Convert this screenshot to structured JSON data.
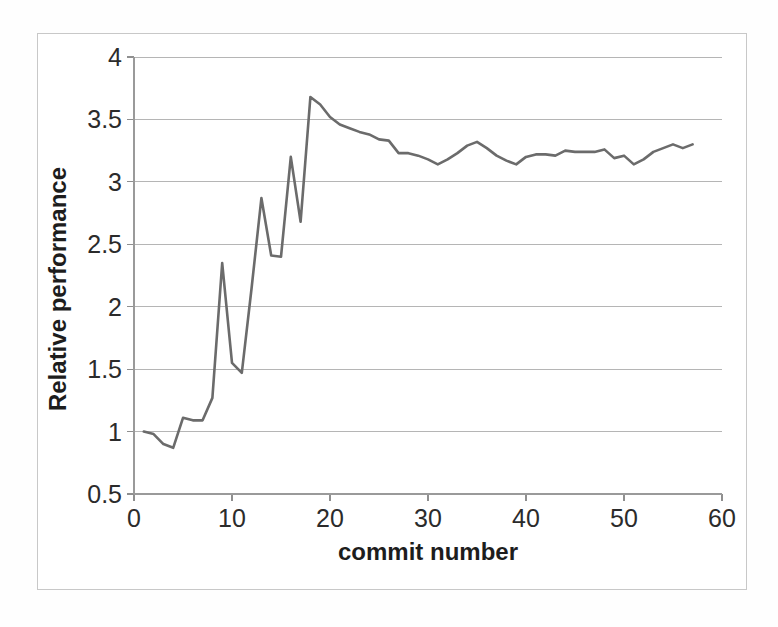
{
  "chart_data": {
    "type": "line",
    "title": "",
    "xlabel": "commit number",
    "ylabel": "Relative performance",
    "xlim": [
      0,
      60
    ],
    "ylim": [
      0.5,
      4
    ],
    "xticks": [
      "0",
      "10",
      "20",
      "30",
      "40",
      "50",
      "60"
    ],
    "xtick_values": [
      0,
      10,
      20,
      30,
      40,
      50,
      60
    ],
    "yticks": [
      "0.5",
      "1",
      "1.5",
      "2",
      "2.5",
      "3",
      "3.5",
      "4"
    ],
    "ytick_values": [
      0.5,
      1,
      1.5,
      2,
      2.5,
      3,
      3.5,
      4
    ],
    "grid": "horizontal",
    "legend": "none",
    "line_color": "#6b6b6b",
    "gridline_color": "#b5b5b5",
    "series": [
      {
        "name": "Relative performance",
        "x": [
          1,
          2,
          3,
          4,
          5,
          6,
          7,
          8,
          9,
          10,
          11,
          12,
          13,
          14,
          15,
          16,
          17,
          18,
          19,
          20,
          21,
          22,
          23,
          24,
          25,
          26,
          27,
          28,
          29,
          30,
          31,
          32,
          33,
          34,
          35,
          36,
          37,
          38,
          39,
          40,
          41,
          42,
          43,
          44,
          45,
          46,
          47,
          48,
          49,
          50,
          51,
          52,
          53,
          54,
          55,
          56,
          57
        ],
        "values": [
          1.0,
          0.98,
          0.9,
          0.87,
          1.11,
          1.09,
          1.09,
          1.27,
          2.35,
          1.55,
          1.47,
          2.15,
          2.87,
          2.41,
          2.4,
          3.2,
          2.68,
          3.68,
          3.62,
          3.52,
          3.46,
          3.43,
          3.4,
          3.38,
          3.34,
          3.33,
          3.23,
          3.23,
          3.21,
          3.18,
          3.14,
          3.18,
          3.23,
          3.29,
          3.32,
          3.27,
          3.21,
          3.17,
          3.14,
          3.2,
          3.22,
          3.22,
          3.21,
          3.25,
          3.24,
          3.24,
          3.24,
          3.26,
          3.19,
          3.21,
          3.14,
          3.18,
          3.24,
          3.27,
          3.3,
          3.27,
          3.3
        ]
      }
    ]
  },
  "axes": {
    "y_title": "Relative performance",
    "x_title": "commit number"
  }
}
